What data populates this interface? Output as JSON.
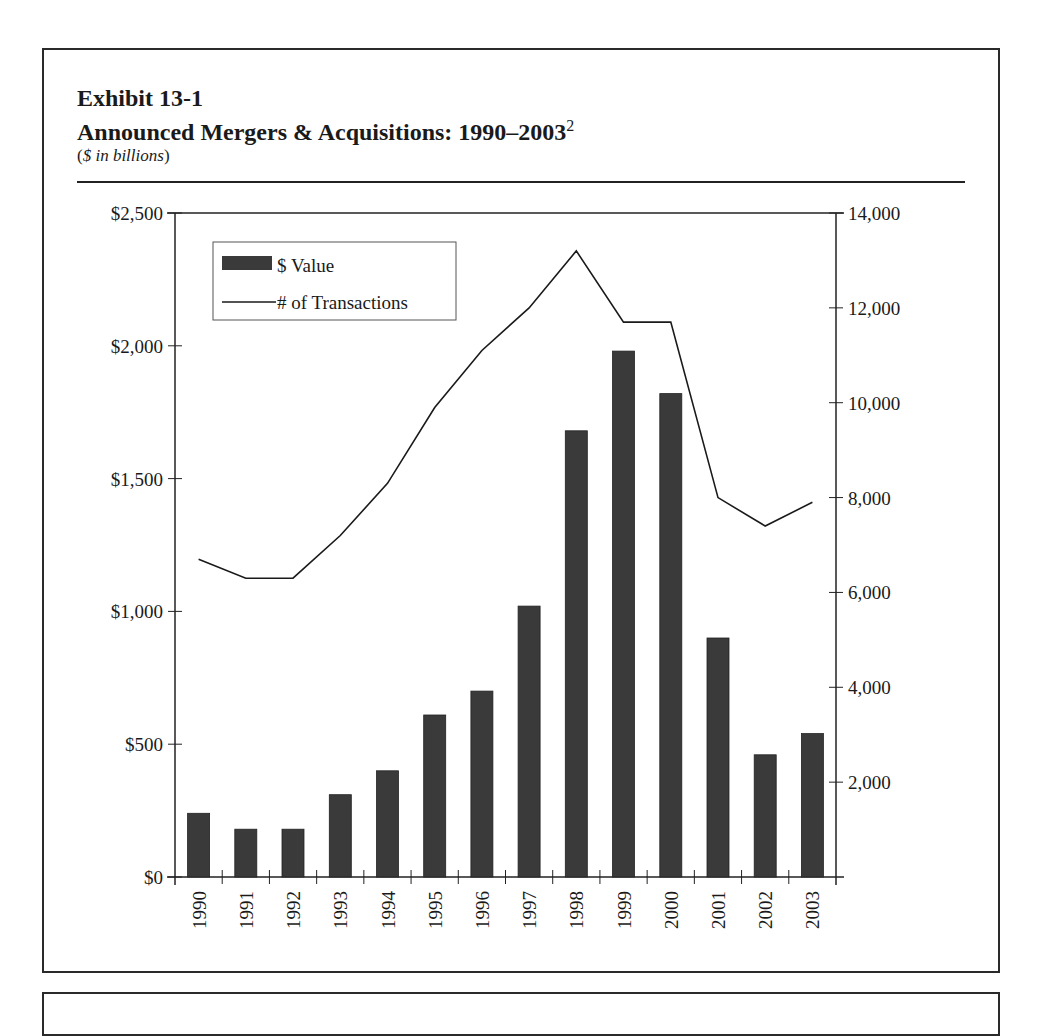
{
  "document": {
    "exhibit_label": "Exhibit 13-1",
    "title": "Announced Mergers & Acquisitions: 1990–2003",
    "title_footnote": "2",
    "units_open": "(",
    "units": "$ in billions",
    "units_close": ")"
  },
  "colors": {
    "bar": "#3a3a3a",
    "line": "#1a1a1a",
    "frame": "#2a2a2a",
    "background": "#ffffff"
  },
  "chart_data": {
    "type": "bar+line",
    "title": "Announced Mergers & Acquisitions: 1990–2003",
    "subtitle": "($ in billions)",
    "xlabel": "",
    "ylabel": "$ Value (billions)",
    "y2label": "# of Transactions",
    "categories": [
      "1990",
      "1991",
      "1992",
      "1993",
      "1994",
      "1995",
      "1996",
      "1997",
      "1998",
      "1999",
      "2000",
      "2001",
      "2002",
      "2003"
    ],
    "series": [
      {
        "name": "$ Value",
        "type": "bar",
        "axis": "left",
        "values": [
          240,
          180,
          180,
          310,
          400,
          610,
          700,
          1020,
          1680,
          1980,
          1820,
          900,
          460,
          540
        ]
      },
      {
        "name": "# of Transactions",
        "type": "line",
        "axis": "right",
        "values": [
          6700,
          6300,
          6300,
          7200,
          8300,
          9900,
          11100,
          12000,
          13200,
          11700,
          11700,
          8000,
          7400,
          7900
        ]
      }
    ],
    "ylim": [
      0,
      2500
    ],
    "y2lim": [
      0,
      14000
    ],
    "y_ticks": [
      0,
      500,
      1000,
      1500,
      2000,
      2500
    ],
    "y_tick_labels": [
      "$0",
      "$500",
      "$1,000",
      "$1,500",
      "$2,000",
      "$2,500"
    ],
    "y2_ticks": [
      2000,
      4000,
      6000,
      8000,
      10000,
      12000,
      14000
    ],
    "y2_tick_labels": [
      "2,000",
      "4,000",
      "6,000",
      "8,000",
      "10,000",
      "12,000",
      "14,000"
    ],
    "x_tick_rotation": -90,
    "grid": false,
    "legend": {
      "position": "upper-left-inside",
      "entries": [
        "$ Value",
        "# of Transactions"
      ]
    }
  }
}
